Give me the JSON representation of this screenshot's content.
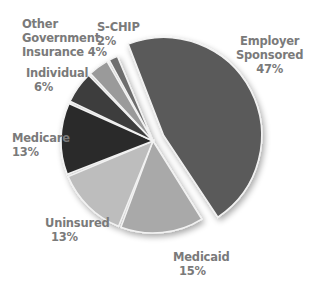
{
  "chart_data": {
    "type": "pie",
    "title": "",
    "unit": "%",
    "exploded": [
      "Employer Sponsored"
    ],
    "slices": [
      {
        "label": "Employer Sponsored",
        "value": 47,
        "display": "47%",
        "color": "#5a5a5a"
      },
      {
        "label": "Medicaid",
        "value": 15,
        "display": "15%",
        "color": "#a9a9a9"
      },
      {
        "label": "Uninsured",
        "value": 13,
        "display": "13%",
        "color": "#bdbdbd"
      },
      {
        "label": "Medicare",
        "value": 13,
        "display": "13%",
        "color": "#2b2b2b"
      },
      {
        "label": "Individual",
        "value": 6,
        "display": "6%",
        "color": "#3e3e3e"
      },
      {
        "label": "Other Government Insurance",
        "value": 4,
        "display": "4%",
        "color": "#9a9a9a"
      },
      {
        "label": "S-CHIP",
        "value": 2,
        "display": "2%",
        "color": "#6e6e6e"
      }
    ],
    "legend": "labels placed around pie (no separate legend)"
  },
  "labels": {
    "employer_1": "Employer",
    "employer_2": "Sponsored",
    "employer_v": "47%",
    "medicaid": "Medicaid",
    "medicaid_v": "15%",
    "uninsured": "Uninsured",
    "uninsured_v": "13%",
    "medicare": "Medicare",
    "medicare_v": "13%",
    "individual": "Individual",
    "individual_v": "6%",
    "other_1": "Other",
    "other_2": "Government",
    "other_3": "Insurance",
    "other_v": "4%",
    "schip": "S-CHIP",
    "schip_v": "2%"
  }
}
